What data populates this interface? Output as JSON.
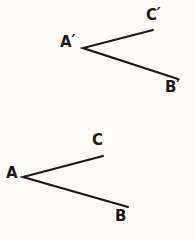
{
  "figure": {
    "background_color": "#fdfcf7",
    "stroke_color": "#1a1714",
    "label_color": "#1a1714",
    "stroke_width": 2.1,
    "width": 195,
    "height": 240
  },
  "shapes": [
    {
      "name": "angle-primed",
      "vertex_label": "A'",
      "ray_end_labels": [
        "C'",
        "B'"
      ],
      "vertex": {
        "x": 83,
        "y": 48
      },
      "ray_ends": [
        {
          "x": 153,
          "y": 30
        },
        {
          "x": 178,
          "y": 79
        }
      ]
    },
    {
      "name": "angle-unprimed",
      "vertex_label": "A",
      "ray_end_labels": [
        "C",
        "B"
      ],
      "vertex": {
        "x": 23,
        "y": 177
      },
      "ray_ends": [
        {
          "x": 103,
          "y": 156
        },
        {
          "x": 128,
          "y": 207
        }
      ]
    }
  ],
  "labels": {
    "a_prime": {
      "base": "A",
      "prime": "′",
      "x": 60,
      "y": 35
    },
    "c_prime": {
      "base": "C",
      "prime": "′",
      "x": 146,
      "y": 8
    },
    "b_prime": {
      "base": "B",
      "prime": "′",
      "x": 165,
      "y": 80
    },
    "a": {
      "base": "A",
      "prime": "",
      "x": 6,
      "y": 166
    },
    "c": {
      "base": "C",
      "prime": "",
      "x": 92,
      "y": 133
    },
    "b": {
      "base": "B",
      "prime": "",
      "x": 115,
      "y": 209
    }
  },
  "chart_data": {
    "type": "diagram",
    "xlabel": "",
    "ylabel": "",
    "xlim": [
      0,
      195
    ],
    "ylim": [
      240,
      0
    ],
    "grid": false,
    "legend": "none",
    "series": [
      {
        "name": "angle-primed",
        "points": [
          {
            "label": "C'",
            "x": 153,
            "y": 30
          },
          {
            "label": "A'",
            "x": 83,
            "y": 48
          },
          {
            "label": "B'",
            "x": 178,
            "y": 79
          }
        ]
      },
      {
        "name": "angle-unprimed",
        "points": [
          {
            "label": "C",
            "x": 103,
            "y": 156
          },
          {
            "label": "A",
            "x": 23,
            "y": 177
          },
          {
            "label": "B",
            "x": 128,
            "y": 207
          }
        ]
      }
    ]
  }
}
